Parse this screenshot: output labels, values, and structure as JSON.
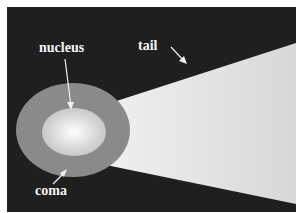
{
  "diagram": {
    "labels": {
      "nucleus": "nucleus",
      "tail": "tail",
      "coma": "coma"
    },
    "colors": {
      "background": "#1f1f1f",
      "coma": "#8a8a8a",
      "nucleus_center": "#fafafa",
      "nucleus_edge": "#cfcfcf",
      "tail": "#e6e6e6",
      "label": "#f4f4f4"
    }
  }
}
